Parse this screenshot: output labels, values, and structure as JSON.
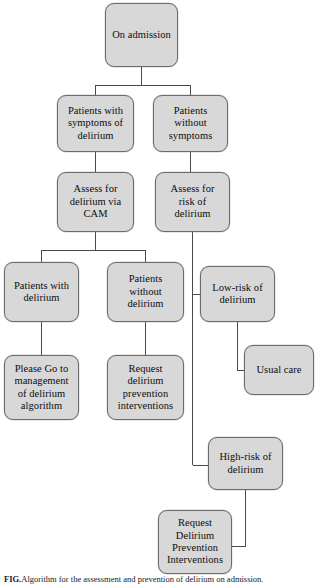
{
  "figure": {
    "type": "clinical-decision-flowchart",
    "caption_prefix": "FIG.",
    "caption_text": "Algorithm for the assessment and prevention of delirium on admission.",
    "colors": {
      "node_fill": "#d8d8d8",
      "node_border": "#6b6b6b",
      "connector": "#4a4a4a",
      "text": "#0d0d0d",
      "background": "#ffffff"
    }
  },
  "nodes": {
    "on_admission": "On admission",
    "patients_with_symptoms": "Patients with\nsymptoms of\ndelirium",
    "patients_without_symptoms": "Patients\nwithout\nsymptoms",
    "assess_cam": "Assess for\ndelirium via\nCAM",
    "assess_risk": "Assess for\nrisk of\ndelirium",
    "patients_with_delirium": "Patients with\ndelirium",
    "patients_without_delirium": "Patients\nwithout\ndelirium",
    "low_risk": "Low-risk of\ndelirium",
    "management_algorithm": "Please Go to\nmanagement\nof delirium\nalgorithm",
    "request_prevention_lower": "Request\ndelirium\nprevention\ninterventions",
    "usual_care": "Usual care",
    "high_risk": "High-risk of\ndelirium",
    "request_prevention_caps": "Request\nDelirium\nPrevention\nInterventions"
  },
  "edges": [
    {
      "from": "on_admission",
      "to": "patients_with_symptoms"
    },
    {
      "from": "on_admission",
      "to": "patients_without_symptoms"
    },
    {
      "from": "patients_with_symptoms",
      "to": "assess_cam"
    },
    {
      "from": "patients_without_symptoms",
      "to": "assess_risk"
    },
    {
      "from": "assess_cam",
      "to": "patients_with_delirium"
    },
    {
      "from": "assess_cam",
      "to": "patients_without_delirium"
    },
    {
      "from": "patients_with_delirium",
      "to": "management_algorithm"
    },
    {
      "from": "patients_without_delirium",
      "to": "request_prevention_lower"
    },
    {
      "from": "assess_risk",
      "to": "low_risk"
    },
    {
      "from": "assess_risk",
      "to": "high_risk"
    },
    {
      "from": "low_risk",
      "to": "usual_care"
    },
    {
      "from": "high_risk",
      "to": "request_prevention_caps"
    }
  ]
}
